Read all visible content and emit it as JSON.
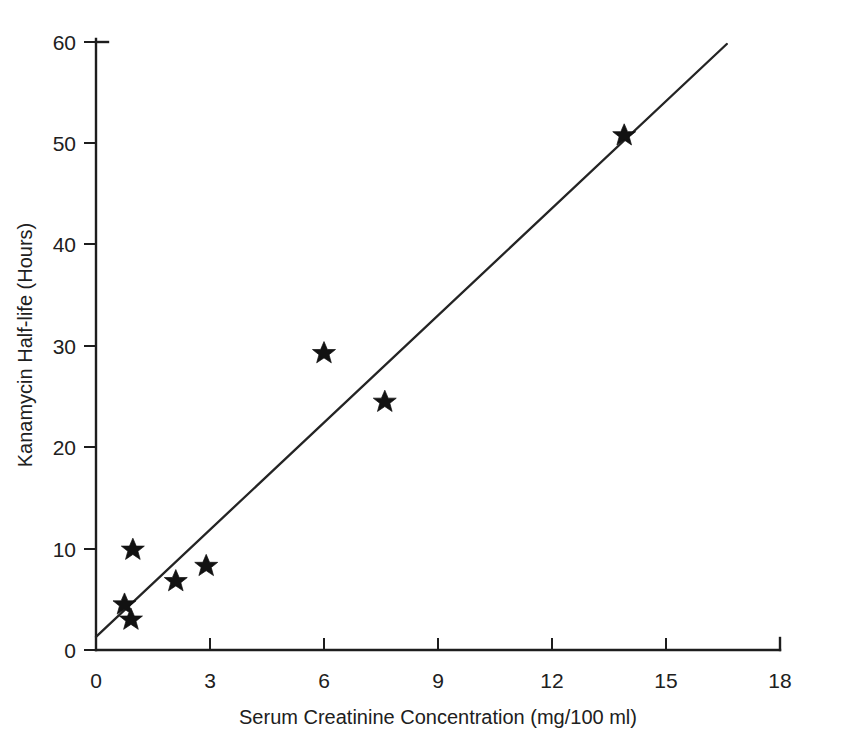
{
  "chart_data": {
    "type": "scatter",
    "title": "",
    "subtitle": "",
    "xlabel": "Serum Creatinine Concentration (mg/100 ml)",
    "ylabel": "Kanamycin Half-life (Hours)",
    "xlim": [
      0,
      18
    ],
    "ylim": [
      0,
      60
    ],
    "xticks": [
      0,
      3,
      6,
      9,
      12,
      15,
      18
    ],
    "yticks": [
      0,
      10,
      20,
      30,
      40,
      50,
      60
    ],
    "xtick_labels": [
      "0",
      "3",
      "6",
      "9",
      "12",
      "15",
      "18"
    ],
    "ytick_labels": [
      "0",
      "10",
      "20",
      "30",
      "40",
      "50",
      "60"
    ],
    "grid": false,
    "legend": false,
    "legend_position": "none",
    "marker": "star",
    "marker_color": "#121212",
    "line_color": "#242424",
    "background_color": "#ffffff",
    "series": [
      {
        "name": "Patients",
        "type": "scatter",
        "points": [
          {
            "x": 0.75,
            "y": 4.5
          },
          {
            "x": 0.92,
            "y": 3.0
          },
          {
            "x": 0.97,
            "y": 9.9
          },
          {
            "x": 2.1,
            "y": 6.8
          },
          {
            "x": 2.9,
            "y": 8.3
          },
          {
            "x": 6.0,
            "y": 29.3
          },
          {
            "x": 7.6,
            "y": 24.5
          },
          {
            "x": 13.9,
            "y": 50.8
          }
        ]
      },
      {
        "name": "Regression line",
        "type": "line",
        "points": [
          {
            "x": 0.0,
            "y": 1.3
          },
          {
            "x": 16.6,
            "y": 59.8
          }
        ]
      }
    ]
  },
  "axes": {
    "x_title": "Serum Creatinine Concentration (mg/100 ml)",
    "y_title": "Kanamycin Half-life (Hours)"
  }
}
